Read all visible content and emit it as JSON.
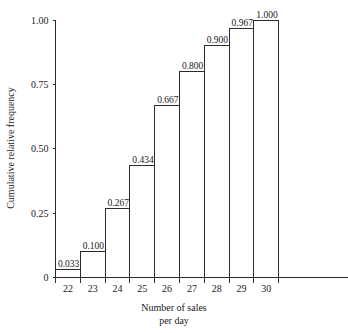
{
  "chart_data": {
    "type": "bar",
    "title": "",
    "subtitle": "",
    "xlabel_line1": "Number of sales",
    "xlabel_line2": "per day",
    "ylabel": "Cumulative relative frequency",
    "categories": [
      "22",
      "23",
      "24",
      "25",
      "26",
      "27",
      "28",
      "29",
      "30"
    ],
    "values": [
      0.033,
      0.1,
      0.267,
      0.434,
      0.667,
      0.8,
      0.9,
      0.967,
      1.0
    ],
    "value_labels": [
      "0.033",
      "0.100",
      "0.267",
      "0.434",
      "0.667",
      "0.800",
      "0.900",
      "0.967",
      "1.000"
    ],
    "ylim": [
      0,
      1.0
    ],
    "xlim_categories": 9,
    "y_ticks": [
      0,
      0.25,
      0.5,
      0.75,
      1.0
    ],
    "y_tick_labels": [
      "0",
      "0.25",
      "0.50",
      "0.75",
      "1.00"
    ],
    "grid": false,
    "legend": "none",
    "bar_fill": "#ffffff",
    "bar_stroke": "#2b2b2b",
    "axis_color": "#2b2b2b",
    "background": "#ffffff"
  }
}
